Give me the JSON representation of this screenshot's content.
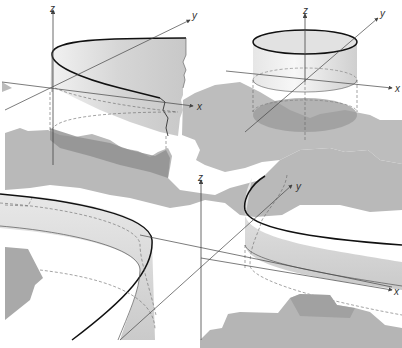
{
  "figure": {
    "colors": {
      "region_fill": "#b8b8b8",
      "region_dark": "#8e8e8e",
      "surface_fill": "#dcdcdc",
      "surface_edge": "#111111",
      "axis": "#444444",
      "dashed": "#666666"
    },
    "panels": [
      {
        "id": "top-left",
        "axes": {
          "x": "x",
          "y": "y",
          "z": "z"
        }
      },
      {
        "id": "top-right",
        "axes": {
          "x": "x",
          "y": "y",
          "z": "z"
        }
      },
      {
        "id": "bottom-left",
        "axes": {
          "z": "z"
        }
      },
      {
        "id": "bottom-right",
        "axes": {
          "x": "x",
          "y": "y",
          "z": "z"
        }
      }
    ]
  }
}
